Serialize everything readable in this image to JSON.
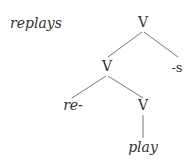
{
  "word": "replays",
  "tree": {
    "root": "V",
    "left_child": "V",
    "suffix": "-s",
    "prefix": "re-",
    "base_node": "V",
    "base_word": "play"
  },
  "colors": {
    "text": "#333333",
    "line": "#555555"
  }
}
